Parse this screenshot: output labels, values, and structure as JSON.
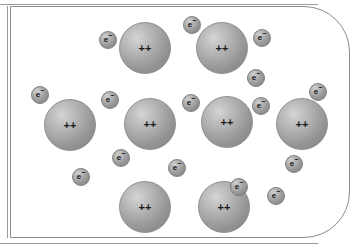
{
  "figure": {
    "background_color": "#ffffff",
    "frame": {
      "border_color": "#8c8c8c",
      "corner_radius_right": 46,
      "corner_radius_left": 0
    }
  },
  "labels": {
    "ion_charge": "++",
    "electron_symbol": "e",
    "electron_superscript": "−"
  },
  "colors": {
    "sphere_light": "#d5d5d5",
    "sphere_mid": "#a9a9a9",
    "sphere_dark": "#8a8a8a",
    "outline": "#8c8c8c",
    "text": "#1a1a1a"
  },
  "ions": [
    {
      "name": "ion-1",
      "cx": 145,
      "cy": 48,
      "r": 26,
      "label": "++"
    },
    {
      "name": "ion-2",
      "cx": 222,
      "cy": 48,
      "r": 26,
      "label": "++"
    },
    {
      "name": "ion-3",
      "cx": 70,
      "cy": 125,
      "r": 26,
      "label": "++"
    },
    {
      "name": "ion-4",
      "cx": 150,
      "cy": 124,
      "r": 26,
      "label": "++"
    },
    {
      "name": "ion-5",
      "cx": 227,
      "cy": 122,
      "r": 26,
      "label": "++"
    },
    {
      "name": "ion-6",
      "cx": 302,
      "cy": 124,
      "r": 26,
      "label": "++"
    },
    {
      "name": "ion-7",
      "cx": 145,
      "cy": 207,
      "r": 26,
      "label": "++"
    },
    {
      "name": "ion-8",
      "cx": 224,
      "cy": 207,
      "r": 26,
      "label": "++"
    }
  ],
  "electrons": [
    {
      "name": "electron-1",
      "cx": 108,
      "cy": 40,
      "r": 9
    },
    {
      "name": "electron-2",
      "cx": 192,
      "cy": 25,
      "r": 9
    },
    {
      "name": "electron-3",
      "cx": 262,
      "cy": 38,
      "r": 9
    },
    {
      "name": "electron-4",
      "cx": 256,
      "cy": 78,
      "r": 9
    },
    {
      "name": "electron-5",
      "cx": 40,
      "cy": 95,
      "r": 9
    },
    {
      "name": "electron-6",
      "cx": 110,
      "cy": 100,
      "r": 9
    },
    {
      "name": "electron-7",
      "cx": 191,
      "cy": 103,
      "r": 9
    },
    {
      "name": "electron-8",
      "cx": 261,
      "cy": 106,
      "r": 9
    },
    {
      "name": "electron-9",
      "cx": 318,
      "cy": 92,
      "r": 9
    },
    {
      "name": "electron-10",
      "cx": 121,
      "cy": 158,
      "r": 9
    },
    {
      "name": "electron-11",
      "cx": 81,
      "cy": 177,
      "r": 9
    },
    {
      "name": "electron-12",
      "cx": 177,
      "cy": 168,
      "r": 9
    },
    {
      "name": "electron-13",
      "cx": 239,
      "cy": 187,
      "r": 9
    },
    {
      "name": "electron-14",
      "cx": 294,
      "cy": 164,
      "r": 9
    },
    {
      "name": "electron-15",
      "cx": 276,
      "cy": 196,
      "r": 9
    }
  ]
}
